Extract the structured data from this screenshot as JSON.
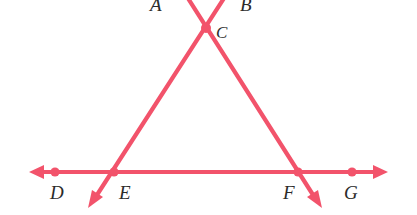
{
  "figure": {
    "type": "geometry-diagram",
    "background_color": "#ffffff",
    "stroke_color": "#f2536b",
    "label_color": "#2b2b2b",
    "stroke_width": 4,
    "canvas": {
      "width": 417,
      "height": 215
    }
  },
  "labels": {
    "a": "A",
    "b": "B",
    "c": "C",
    "d": "D",
    "e": "E",
    "f": "F",
    "g": "G"
  },
  "points": [
    {
      "name": "C",
      "label": "C",
      "x": 206,
      "y": 28,
      "marked": true,
      "label_x": 215,
      "label_y": 26
    },
    {
      "name": "D",
      "label": "D",
      "x": 55,
      "y": 172,
      "marked": true,
      "label_x": 50,
      "label_y": 182
    },
    {
      "name": "E",
      "label": "E",
      "x": 114,
      "y": 172,
      "marked": true,
      "label_x": 120,
      "label_y": 182
    },
    {
      "name": "F",
      "label": "F",
      "x": 298,
      "y": 172,
      "marked": true,
      "label_x": 283,
      "label_y": 182
    },
    {
      "name": "G",
      "label": "G",
      "x": 352,
      "y": 172,
      "marked": true,
      "label_x": 345,
      "label_y": 182
    },
    {
      "name": "A",
      "label": "A",
      "x": 186,
      "y": 0,
      "marked": false,
      "label_x": 150,
      "label_y": -4
    },
    {
      "name": "B",
      "label": "B",
      "x": 226,
      "y": 0,
      "marked": false,
      "label_x": 238,
      "label_y": -4
    }
  ],
  "segments": [
    {
      "name": "line-A-to-lower-right",
      "x1": 186,
      "y1": -6,
      "x2": 320,
      "y2": 205,
      "arrow_end": true
    },
    {
      "name": "line-B-to-lower-left",
      "x1": 228,
      "y1": -6,
      "x2": 90,
      "y2": 205,
      "arrow_end": true
    },
    {
      "name": "horizontal-line-DG",
      "x1": 32,
      "y1": 172,
      "x2": 386,
      "y2": 172,
      "arrow_start": true,
      "arrow_end": true
    }
  ],
  "dot_radius": 4.5
}
